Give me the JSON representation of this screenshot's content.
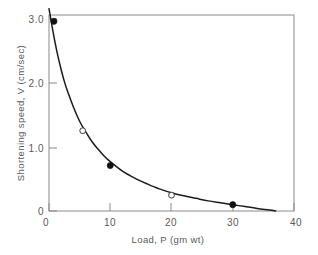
{
  "chart_data": {
    "type": "scatter",
    "title": "",
    "xlabel": "Load, P (gm wt)",
    "ylabel": "Shortening speed, V (cm/sec)",
    "xlim": [
      0,
      40
    ],
    "ylim": [
      0,
      3.1
    ],
    "xticks": [
      "0",
      "10",
      "20",
      "30",
      "40"
    ],
    "xtick_values": [
      0,
      10,
      20,
      30,
      40
    ],
    "yticks": [
      "0",
      "1.0",
      "2.0",
      "3.0"
    ],
    "ytick_values": [
      0,
      1.0,
      2.0,
      3.0
    ],
    "grid": false,
    "legend": "none",
    "series": [
      {
        "name": "filled points",
        "marker": "filled-circle",
        "x": [
          0.8,
          10.0,
          30.0
        ],
        "y": [
          3.0,
          0.72,
          0.1
        ]
      },
      {
        "name": "open points",
        "marker": "open-circle",
        "x": [
          5.5,
          20.0
        ],
        "y": [
          1.27,
          0.25
        ]
      }
    ],
    "curve": {
      "name": "force-velocity hyperbola",
      "x": [
        0.0,
        0.5,
        1.0,
        1.5,
        2.0,
        2.5,
        3.0,
        4.0,
        5.0,
        6.0,
        7.0,
        8.0,
        9.0,
        10.0,
        12.0,
        14.0,
        16.0,
        18.0,
        20.0,
        22.0,
        24.0,
        26.0,
        28.0,
        30.0,
        32.0,
        34.0,
        36.0,
        37.0
      ],
      "y": [
        3.2,
        2.92,
        2.66,
        2.43,
        2.23,
        2.05,
        1.9,
        1.64,
        1.42,
        1.25,
        1.1,
        0.98,
        0.87,
        0.78,
        0.63,
        0.52,
        0.43,
        0.35,
        0.29,
        0.24,
        0.2,
        0.16,
        0.13,
        0.1,
        0.07,
        0.04,
        0.015,
        0.0
      ]
    }
  },
  "figure": {
    "plot_area": {
      "left": 49,
      "top": 15,
      "right": 294,
      "bottom": 211
    },
    "background_color": "#ffffff",
    "axis_color": "#8a8a8a",
    "curve_color": "#1b1b1b",
    "marker_fill_color": "#111111",
    "marker_open_color": "#ffffff"
  }
}
